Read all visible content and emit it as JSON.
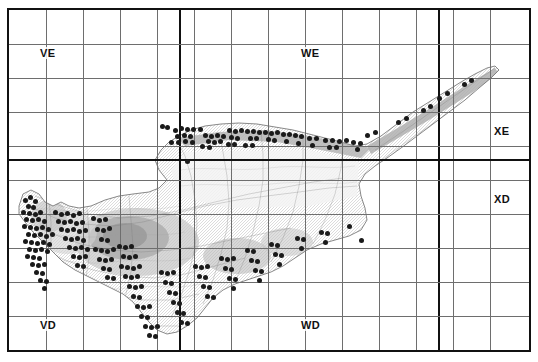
{
  "figure": {
    "region_name": "Cyprus",
    "background_color": "#ffffff",
    "frame_color": "#111111",
    "grid_line_color": "#6e6e6e",
    "grid_major_color": "#111111",
    "dot_color": "#1a1a1a"
  },
  "grid": {
    "columns": 14,
    "rows": 10,
    "cell_width_px": 37,
    "cell_height_px": 34,
    "major_vertical_lines_px": [
      170,
      429
    ],
    "major_horizontal_lines_px": [
      149
    ],
    "square_labels": [
      {
        "text": "VE",
        "x": 30,
        "y": 37
      },
      {
        "text": "WE",
        "x": 291,
        "y": 37
      },
      {
        "text": "XE",
        "x": 484,
        "y": 115
      },
      {
        "text": "XD",
        "x": 484,
        "y": 183
      },
      {
        "text": "VD",
        "x": 30,
        "y": 309
      },
      {
        "text": "WD",
        "x": 291,
        "y": 309
      }
    ]
  },
  "chart_data": {
    "type": "scatter",
    "xlabel": "",
    "ylabel": "",
    "legend": [],
    "point_count": 193,
    "points": [
      [
        166,
        120
      ],
      [
        172,
        118
      ],
      [
        178,
        119
      ],
      [
        184,
        119
      ],
      [
        191,
        119
      ],
      [
        168,
        126
      ],
      [
        175,
        125
      ],
      [
        181,
        126
      ],
      [
        162,
        132
      ],
      [
        169,
        132
      ],
      [
        176,
        131
      ],
      [
        183,
        132
      ],
      [
        153,
        116
      ],
      [
        158,
        117
      ],
      [
        196,
        125
      ],
      [
        202,
        126
      ],
      [
        208,
        125
      ],
      [
        214,
        126
      ],
      [
        199,
        131
      ],
      [
        205,
        132
      ],
      [
        211,
        131
      ],
      [
        193,
        136
      ],
      [
        200,
        137
      ],
      [
        220,
        120
      ],
      [
        226,
        121
      ],
      [
        232,
        120
      ],
      [
        222,
        127
      ],
      [
        228,
        128
      ],
      [
        219,
        134
      ],
      [
        225,
        134
      ],
      [
        238,
        121
      ],
      [
        244,
        121
      ],
      [
        250,
        122
      ],
      [
        241,
        128
      ],
      [
        247,
        128
      ],
      [
        236,
        135
      ],
      [
        243,
        135
      ],
      [
        256,
        122
      ],
      [
        262,
        123
      ],
      [
        268,
        122
      ],
      [
        259,
        129
      ],
      [
        265,
        130
      ],
      [
        274,
        124
      ],
      [
        280,
        124
      ],
      [
        277,
        131
      ],
      [
        286,
        125
      ],
      [
        292,
        126
      ],
      [
        289,
        133
      ],
      [
        300,
        128
      ],
      [
        307,
        128
      ],
      [
        303,
        135
      ],
      [
        316,
        130
      ],
      [
        323,
        130
      ],
      [
        330,
        131
      ],
      [
        337,
        130
      ],
      [
        320,
        137
      ],
      [
        327,
        137
      ],
      [
        344,
        132
      ],
      [
        351,
        133
      ],
      [
        348,
        139
      ],
      [
        178,
        151
      ],
      [
        358,
        125
      ],
      [
        366,
        122
      ],
      [
        389,
        112
      ],
      [
        397,
        108
      ],
      [
        414,
        100
      ],
      [
        421,
        96
      ],
      [
        430,
        88
      ],
      [
        438,
        83
      ],
      [
        455,
        74
      ],
      [
        462,
        70
      ],
      [
        16,
        190
      ],
      [
        21,
        187
      ],
      [
        26,
        191
      ],
      [
        19,
        196
      ],
      [
        24,
        197
      ],
      [
        14,
        202
      ],
      [
        20,
        203
      ],
      [
        26,
        204
      ],
      [
        31,
        202
      ],
      [
        17,
        209
      ],
      [
        23,
        210
      ],
      [
        29,
        209
      ],
      [
        35,
        211
      ],
      [
        15,
        216
      ],
      [
        21,
        217
      ],
      [
        27,
        218
      ],
      [
        33,
        217
      ],
      [
        39,
        219
      ],
      [
        19,
        224
      ],
      [
        25,
        225
      ],
      [
        31,
        224
      ],
      [
        37,
        226
      ],
      [
        43,
        224
      ],
      [
        16,
        231
      ],
      [
        22,
        232
      ],
      [
        28,
        233
      ],
      [
        34,
        232
      ],
      [
        40,
        234
      ],
      [
        20,
        239
      ],
      [
        26,
        240
      ],
      [
        32,
        239
      ],
      [
        38,
        241
      ],
      [
        18,
        246
      ],
      [
        24,
        247
      ],
      [
        30,
        248
      ],
      [
        23,
        254
      ],
      [
        29,
        255
      ],
      [
        35,
        254
      ],
      [
        27,
        262
      ],
      [
        33,
        263
      ],
      [
        31,
        270
      ],
      [
        37,
        271
      ],
      [
        35,
        278
      ],
      [
        46,
        202
      ],
      [
        52,
        204
      ],
      [
        58,
        203
      ],
      [
        64,
        205
      ],
      [
        70,
        203
      ],
      [
        49,
        211
      ],
      [
        55,
        212
      ],
      [
        61,
        211
      ],
      [
        67,
        213
      ],
      [
        73,
        212
      ],
      [
        52,
        219
      ],
      [
        58,
        220
      ],
      [
        64,
        219
      ],
      [
        70,
        221
      ],
      [
        76,
        220
      ],
      [
        56,
        228
      ],
      [
        62,
        229
      ],
      [
        68,
        228
      ],
      [
        74,
        230
      ],
      [
        60,
        237
      ],
      [
        66,
        238
      ],
      [
        72,
        237
      ],
      [
        78,
        239
      ],
      [
        64,
        246
      ],
      [
        70,
        247
      ],
      [
        76,
        246
      ],
      [
        68,
        255
      ],
      [
        74,
        256
      ],
      [
        84,
        208
      ],
      [
        90,
        210
      ],
      [
        96,
        209
      ],
      [
        88,
        219
      ],
      [
        94,
        220
      ],
      [
        100,
        218
      ],
      [
        92,
        229
      ],
      [
        98,
        230
      ],
      [
        86,
        239
      ],
      [
        92,
        240
      ],
      [
        98,
        241
      ],
      [
        104,
        239
      ],
      [
        90,
        249
      ],
      [
        96,
        250
      ],
      [
        102,
        249
      ],
      [
        94,
        258
      ],
      [
        100,
        259
      ],
      [
        98,
        267
      ],
      [
        104,
        268
      ],
      [
        110,
        236
      ],
      [
        116,
        237
      ],
      [
        122,
        236
      ],
      [
        114,
        246
      ],
      [
        120,
        247
      ],
      [
        126,
        246
      ],
      [
        112,
        256
      ],
      [
        118,
        257
      ],
      [
        124,
        258
      ],
      [
        130,
        256
      ],
      [
        116,
        266
      ],
      [
        122,
        267
      ],
      [
        128,
        266
      ],
      [
        120,
        276
      ],
      [
        126,
        277
      ],
      [
        132,
        276
      ],
      [
        124,
        286
      ],
      [
        130,
        287
      ],
      [
        128,
        296
      ],
      [
        134,
        297
      ],
      [
        140,
        296
      ],
      [
        132,
        306
      ],
      [
        138,
        307
      ],
      [
        136,
        316
      ],
      [
        142,
        317
      ],
      [
        148,
        316
      ],
      [
        140,
        325
      ],
      [
        146,
        326
      ],
      [
        152,
        262
      ],
      [
        158,
        263
      ],
      [
        164,
        262
      ],
      [
        156,
        272
      ],
      [
        162,
        273
      ],
      [
        160,
        282
      ],
      [
        166,
        283
      ],
      [
        164,
        292
      ],
      [
        170,
        293
      ],
      [
        168,
        302
      ],
      [
        174,
        303
      ],
      [
        172,
        312
      ],
      [
        178,
        313
      ],
      [
        186,
        256
      ],
      [
        192,
        257
      ],
      [
        198,
        256
      ],
      [
        190,
        266
      ],
      [
        196,
        267
      ],
      [
        194,
        276
      ],
      [
        200,
        277
      ],
      [
        198,
        286
      ],
      [
        204,
        287
      ],
      [
        212,
        248
      ],
      [
        218,
        249
      ],
      [
        224,
        248
      ],
      [
        216,
        258
      ],
      [
        222,
        259
      ],
      [
        220,
        268
      ],
      [
        226,
        269
      ],
      [
        224,
        278
      ],
      [
        238,
        240
      ],
      [
        244,
        241
      ],
      [
        242,
        250
      ],
      [
        248,
        251
      ],
      [
        246,
        260
      ],
      [
        252,
        261
      ],
      [
        250,
        270
      ],
      [
        262,
        234
      ],
      [
        268,
        235
      ],
      [
        266,
        244
      ],
      [
        272,
        245
      ],
      [
        270,
        254
      ],
      [
        288,
        228
      ],
      [
        294,
        229
      ],
      [
        292,
        238
      ],
      [
        312,
        222
      ],
      [
        318,
        223
      ],
      [
        316,
        232
      ],
      [
        340,
        216
      ],
      [
        352,
        230
      ]
    ]
  }
}
